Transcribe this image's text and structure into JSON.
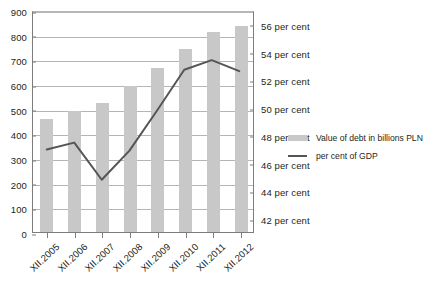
{
  "chart_data": {
    "type": "bar",
    "title": "",
    "subtitle": "",
    "xlabel": "",
    "ylabel": "",
    "grid": true,
    "legend_position": "right",
    "categories": [
      "XII.2005",
      "XII.2006",
      "XII.2007",
      "XII.2008",
      "XII.2009",
      "XII.2010",
      "XII.2011",
      "XII.2012"
    ],
    "series": [
      {
        "name": "Value of debt in billions PLN",
        "type": "bar",
        "axis": "left",
        "color": "#c8c8c8",
        "values": [
          460,
          490,
          525,
          590,
          665,
          740,
          810,
          835
        ]
      },
      {
        "name": "per cent of GDP",
        "type": "line",
        "axis": "right",
        "color": "#555555",
        "values": [
          47.0,
          47.5,
          44.8,
          46.9,
          49.8,
          52.8,
          53.5,
          52.7
        ]
      }
    ],
    "left_axis": {
      "ylim": [
        0,
        900
      ],
      "step": 100,
      "ticks": [
        "0",
        "100",
        "200",
        "300",
        "400",
        "500",
        "600",
        "700",
        "800",
        "900"
      ]
    },
    "right_axis": {
      "ylim": [
        41,
        57
      ],
      "step": 2,
      "ticks": [
        "42 per cent",
        "44 per cent",
        "46 per cent",
        "48 per cent",
        "50 per cent",
        "52 per cent",
        "54 per cent",
        "56 per cent"
      ],
      "tick_values": [
        42,
        44,
        46,
        48,
        50,
        52,
        54,
        56
      ]
    },
    "legend": [
      {
        "label": "Value of debt in billions PLN",
        "marker": "bar",
        "color": "#c8c8c8"
      },
      {
        "label": "per cent of GDP",
        "marker": "line",
        "color": "#555555"
      }
    ]
  }
}
